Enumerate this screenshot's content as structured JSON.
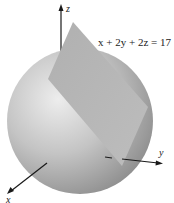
{
  "figure": {
    "equation": "x + 2y + 2z = 17",
    "axes": {
      "z_label": "z",
      "y_label": "y",
      "x_label": "x"
    },
    "objects": [
      "sphere",
      "tangent-plane"
    ],
    "colors": {
      "sphere_light": "#e6e6e6",
      "sphere_dark": "#8e8e8e",
      "plane": "#b8b8b8",
      "axis": "#1a1a1a"
    }
  }
}
